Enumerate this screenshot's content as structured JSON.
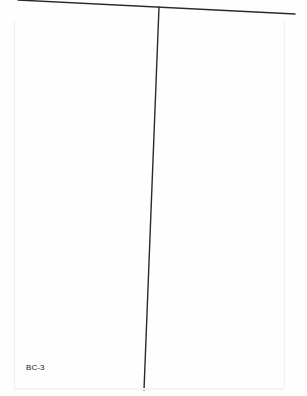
{
  "page": {
    "footer_code": "BC-3",
    "colors": {
      "line": "#2a2a2a",
      "background": "#fefefe",
      "text": "#222222"
    }
  },
  "tchart": {
    "horizontal_line": {
      "x1": 18,
      "y1": 0,
      "x2": 295,
      "y2": 14
    },
    "vertical_line": {
      "x1": 159,
      "y1": 7,
      "x2": 144,
      "y2": 390
    },
    "left_column": {
      "items": []
    },
    "right_column": {
      "items": []
    }
  }
}
